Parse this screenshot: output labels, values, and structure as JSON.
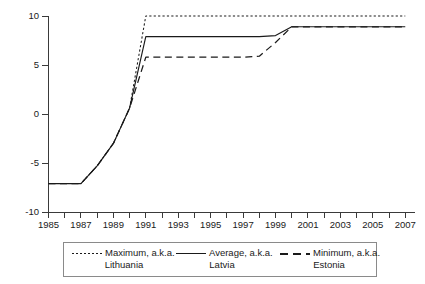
{
  "chart_data": {
    "type": "line",
    "title": "",
    "subtitle": "",
    "xlabel": "",
    "ylabel": "",
    "xlim": [
      1985,
      2007.6
    ],
    "ylim": [
      -10,
      10
    ],
    "grid": false,
    "legend_position": "bottom",
    "x_ticks": [
      "1985",
      "1986",
      "1987",
      "1988",
      "1989",
      "1990",
      "1991",
      "1992",
      "1993",
      "1994",
      "1995",
      "1996",
      "1997",
      "1998",
      "1999",
      "2000",
      "2001",
      "2002",
      "2003",
      "2004",
      "2005",
      "2006",
      "2007"
    ],
    "x_tick_labels_shown": [
      "1985",
      "1987",
      "1989",
      "1991",
      "1993",
      "1995",
      "1997",
      "1999",
      "2001",
      "2003",
      "2005",
      "2007"
    ],
    "y_ticks": [
      "10",
      "5",
      "0",
      "-5",
      "-10"
    ],
    "y_tick_values": [
      10,
      5,
      0,
      -5,
      -10
    ],
    "x": [
      1985,
      1986,
      1987,
      1988,
      1989,
      1990,
      1991,
      1992,
      1993,
      1994,
      1995,
      1996,
      1997,
      1998,
      1999,
      2000,
      2001,
      2002,
      2003,
      2004,
      2005,
      2006,
      2007
    ],
    "series": [
      {
        "name": "Maximum, a.k.a. Lithuania",
        "style": "dotted",
        "values": [
          -7.1,
          -7.1,
          -7.1,
          -5.3,
          -3.0,
          0.6,
          10.0,
          10.0,
          10.0,
          10.0,
          10.0,
          10.0,
          10.0,
          10.0,
          10.0,
          10.0,
          10.0,
          10.0,
          10.0,
          10.0,
          10.0,
          10.0,
          10.0
        ]
      },
      {
        "name": "Average, a.k.a. Latvia",
        "style": "solid",
        "values": [
          -7.1,
          -7.1,
          -7.1,
          -5.3,
          -3.0,
          0.6,
          7.9,
          7.9,
          7.9,
          7.9,
          7.9,
          7.9,
          7.9,
          7.9,
          8.0,
          8.9,
          8.9,
          8.9,
          8.9,
          8.9,
          8.9,
          8.9,
          8.9
        ]
      },
      {
        "name": "Minimum, a.k.a. Estonia",
        "style": "dashed",
        "values": [
          -7.1,
          -7.1,
          -7.1,
          -5.3,
          -3.0,
          0.6,
          5.8,
          5.8,
          5.8,
          5.8,
          5.8,
          5.8,
          5.8,
          5.9,
          7.3,
          8.9,
          8.9,
          8.9,
          8.9,
          8.9,
          8.9,
          8.9,
          8.9
        ]
      }
    ]
  },
  "legend": {
    "entries": [
      {
        "main": "Maximum, a.k.a.",
        "sub": "Lithuania",
        "key": "dotted-line-key"
      },
      {
        "main": "Average, a.k.a.",
        "sub": "Latvia",
        "key": "solid-line-key"
      },
      {
        "main": "Minimum, a.k.a.",
        "sub": "Estonia",
        "key": "dashed-line-key"
      }
    ]
  }
}
